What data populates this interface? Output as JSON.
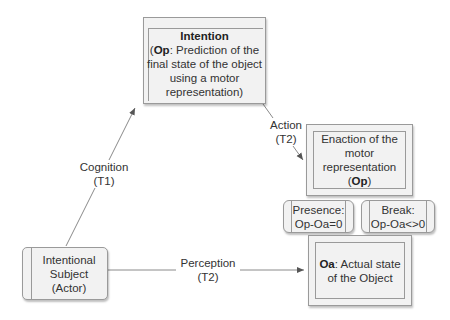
{
  "nodes": {
    "intention": {
      "title": "Intention",
      "bold_prefix": "Op",
      "line1_rest": ": Prediction of the",
      "line2": "final state of the object",
      "line3": "using a motor",
      "line4": "representation)",
      "open_paren": "("
    },
    "enaction": {
      "line1": "Enaction of the",
      "line2": "motor",
      "line3": "representation",
      "bold": "Op"
    },
    "presence": {
      "line1": "Presence:",
      "line2": "Op-Oa=0"
    },
    "break": {
      "line1": "Break:",
      "line2": "Op-Oa<>0"
    },
    "oa": {
      "bold_prefix": "Oa",
      "line1_rest": ": Actual state",
      "line2": "of the Object"
    },
    "actor": {
      "line1": "Intentional",
      "line2": "Subject",
      "line3": "(Actor)"
    }
  },
  "edges": {
    "cognition": {
      "line1": "Cognition",
      "line2": "(T1)"
    },
    "action": {
      "line1": "Action",
      "line2": "(T2)"
    },
    "perception": {
      "line1": "Perception",
      "line2": "(T2)"
    }
  },
  "colors": {
    "line": "#8a8a8a",
    "fill": "#f2f2f2",
    "border": "#9a9a9a"
  }
}
